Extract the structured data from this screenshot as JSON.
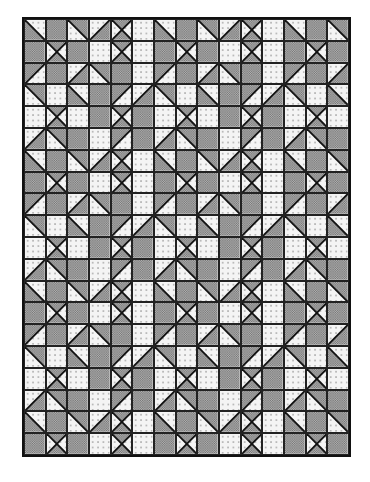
{
  "colors": {
    "dark": "#9a9a9a",
    "light": "#f4f4f4",
    "dot": "#555555",
    "line": "#111111"
  },
  "grid": {
    "cols": 15,
    "rows": 20,
    "legend": {
      "D": "dark solid square",
      "L": "light dotted square",
      "X": "hourglass (dark top/bottom, light sides)",
      "A": "half-square triangle dark lower-right",
      "B": "half-square triangle dark lower-left",
      "C": "half-square triangle dark upper-left",
      "E": "half-square triangle dark upper-right"
    },
    "pattern": [
      "BDEAXLBDEAXLBDE",
      "DXDLXLDXDLXLDXD",
      "CDAEDLCDAEDLCDA",
      "ELBDCAELBDCAELB",
      "LXLDXDLXLDXDLXL",
      "AEDLCDAEDLCDAED",
      "BDEAXLBDEAXLBDE",
      "DXDLXLDXDLXLDXD",
      "CDAEDLCDAEDLCDA",
      "ELBDCAELBDCAELB",
      "LXLDXDLXLDXDLXL",
      "AEDLCDAEDLCDAED",
      "BDEAXLBDEAXLBDE",
      "DXDLXLDXDLXLDXD",
      "CDAEDLCDAEDLCDA",
      "ELBDCAELBDCAELB",
      "LXLDXDLXLDXDLXL",
      "AEDLCDAEDLCDAED",
      "BDEAXLBDEAXLBDE",
      "DXDLXLDXDLXLDXD"
    ]
  }
}
